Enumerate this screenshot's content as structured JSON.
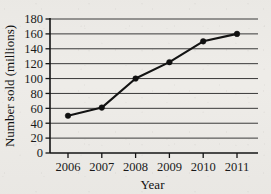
{
  "chart_data": {
    "type": "line",
    "title": "",
    "xlabel": "Year",
    "ylabel": "Number sold (millions)",
    "categories": [
      "2006",
      "2007",
      "2008",
      "2009",
      "2010",
      "2011"
    ],
    "x": [
      2006,
      2007,
      2008,
      2009,
      2010,
      2011
    ],
    "values": [
      50,
      61,
      100,
      122,
      150,
      160
    ],
    "series": [
      {
        "name": "Number sold",
        "values": [
          50,
          61,
          100,
          122,
          150,
          160
        ]
      }
    ],
    "ylim": [
      0,
      180
    ],
    "ytick_labels": [
      "0",
      "20",
      "40",
      "60",
      "80",
      "100",
      "120",
      "140",
      "160",
      "180"
    ],
    "ytick_values": [
      0,
      20,
      40,
      60,
      80,
      100,
      120,
      140,
      160,
      180
    ],
    "xtick_labels": [
      "2006",
      "2007",
      "2008",
      "2009",
      "2010",
      "2011"
    ],
    "grid": true,
    "grid_axis": "y",
    "legend": false,
    "legend_position": "none",
    "marker": "circle",
    "line_color": "#131313",
    "marker_color": "#101010",
    "grid_color": "#3a3a3a",
    "background_color": "#eeece8"
  }
}
